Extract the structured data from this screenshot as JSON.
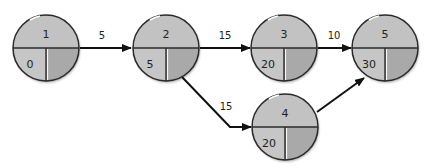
{
  "diagram": {
    "type": "network-activity-on-node",
    "colors": {
      "top_fill": "#c2c2c2",
      "bottom_left_fill": "#c6c6c6",
      "bottom_right_fill": "#a9a9a9",
      "outline": "#2a2a2a",
      "arrow": "#111111",
      "highlight": "#ffffff"
    },
    "nodes": [
      {
        "id": "1",
        "label": "1",
        "value": "0",
        "cx": 46,
        "cy": 48,
        "r": 33
      },
      {
        "id": "2",
        "label": "2",
        "value": "5",
        "cx": 166,
        "cy": 48,
        "r": 33
      },
      {
        "id": "3",
        "label": "3",
        "value": "20",
        "cx": 284,
        "cy": 48,
        "r": 33
      },
      {
        "id": "5",
        "label": "5",
        "value": "30",
        "cx": 385,
        "cy": 48,
        "r": 33
      },
      {
        "id": "4",
        "label": "4",
        "value": "20",
        "cx": 285,
        "cy": 127,
        "r": 33
      }
    ],
    "edges": [
      {
        "from": "1",
        "to": "2",
        "label": "5"
      },
      {
        "from": "2",
        "to": "3",
        "label": "15"
      },
      {
        "from": "3",
        "to": "5",
        "label": "10"
      },
      {
        "from": "2",
        "to": "4",
        "label": "15"
      },
      {
        "from": "4",
        "to": "5",
        "label": ""
      }
    ]
  }
}
